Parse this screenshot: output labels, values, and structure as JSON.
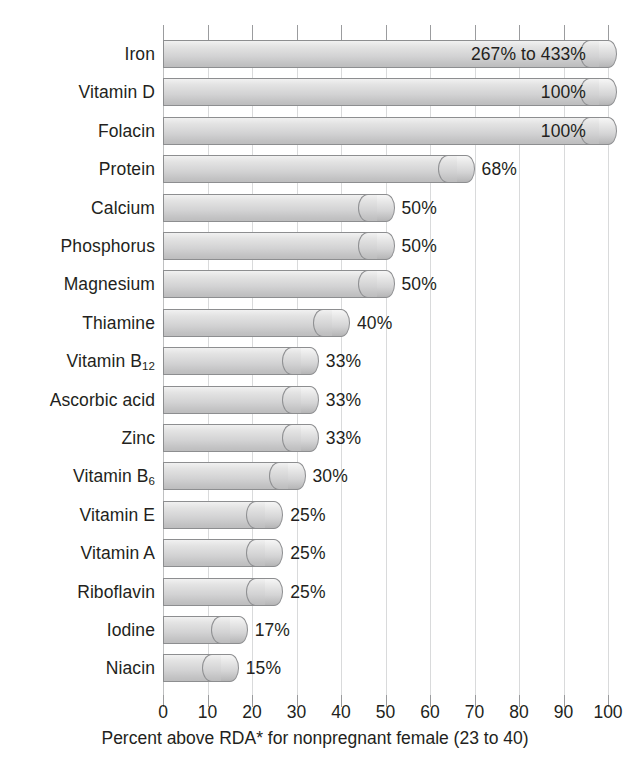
{
  "chart_data": {
    "type": "bar",
    "orientation": "horizontal",
    "title": "",
    "xlabel": "Percent above RDA* for nonpregnant female (23 to 40)",
    "ylabel": "",
    "xlim": [
      0,
      100
    ],
    "xticks": [
      0,
      10,
      20,
      30,
      40,
      50,
      60,
      70,
      80,
      90,
      100
    ],
    "xtick_labels": [
      "0",
      "10",
      "20",
      "30",
      "40",
      "50",
      "60",
      "70",
      "80",
      "90",
      "100"
    ],
    "grid": true,
    "legend": "none",
    "categories": [
      "Iron",
      "Vitamin D",
      "Folacin",
      "Protein",
      "Calcium",
      "Phosphorus",
      "Magnesium",
      "Thiamine",
      "Vitamin B12",
      "Ascorbic acid",
      "Zinc",
      "Vitamin B6",
      "Vitamin E",
      "Vitamin A",
      "Riboflavin",
      "Iodine",
      "Niacin"
    ],
    "values": [
      100,
      100,
      100,
      68,
      50,
      50,
      50,
      40,
      33,
      33,
      33,
      30,
      25,
      25,
      25,
      17,
      15
    ],
    "value_labels": [
      "267% to 433%",
      "100%",
      "100%",
      "68%",
      "50%",
      "50%",
      "50%",
      "40%",
      "33%",
      "33%",
      "33%",
      "30%",
      "25%",
      "25%",
      "25%",
      "17%",
      "15%"
    ]
  },
  "rows": [
    {
      "label_html": "Iron",
      "label": "Iron",
      "value": 100,
      "value_label": "267% to 433%",
      "label_inside": true
    },
    {
      "label_html": "Vitamin D",
      "label": "Vitamin D",
      "value": 100,
      "value_label": "100%",
      "label_inside": true
    },
    {
      "label_html": "Folacin",
      "label": "Folacin",
      "value": 100,
      "value_label": "100%",
      "label_inside": true
    },
    {
      "label_html": "Protein",
      "label": "Protein",
      "value": 68,
      "value_label": "68%",
      "label_inside": false
    },
    {
      "label_html": "Calcium",
      "label": "Calcium",
      "value": 50,
      "value_label": "50%",
      "label_inside": false
    },
    {
      "label_html": "Phosphorus",
      "label": "Phosphorus",
      "value": 50,
      "value_label": "50%",
      "label_inside": false
    },
    {
      "label_html": "Magnesium",
      "label": "Magnesium",
      "value": 50,
      "value_label": "50%",
      "label_inside": false
    },
    {
      "label_html": "Thiamine",
      "label": "Thiamine",
      "value": 40,
      "value_label": "40%",
      "label_inside": false
    },
    {
      "label_html": "Vitamin B<sub>12</sub>",
      "label": "Vitamin B12",
      "value": 33,
      "value_label": "33%",
      "label_inside": false
    },
    {
      "label_html": "Ascorbic acid",
      "label": "Ascorbic acid",
      "value": 33,
      "value_label": "33%",
      "label_inside": false
    },
    {
      "label_html": "Zinc",
      "label": "Zinc",
      "value": 33,
      "value_label": "33%",
      "label_inside": false
    },
    {
      "label_html": "Vitamin B<sub>6</sub>",
      "label": "Vitamin B6",
      "value": 30,
      "value_label": "30%",
      "label_inside": false
    },
    {
      "label_html": "Vitamin E",
      "label": "Vitamin E",
      "value": 25,
      "value_label": "25%",
      "label_inside": false
    },
    {
      "label_html": "Vitamin A",
      "label": "Vitamin A",
      "value": 25,
      "value_label": "25%",
      "label_inside": false
    },
    {
      "label_html": "Riboflavin",
      "label": "Riboflavin",
      "value": 25,
      "value_label": "25%",
      "label_inside": false
    },
    {
      "label_html": "Iodine",
      "label": "Iodine",
      "value": 17,
      "value_label": "17%",
      "label_inside": false
    },
    {
      "label_html": "Niacin",
      "label": "Niacin",
      "value": 15,
      "value_label": "15%",
      "label_inside": false
    }
  ],
  "axis": {
    "caption": "Percent above RDA* for nonpregnant female (23 to 40)",
    "ticks": [
      "0",
      "10",
      "20",
      "30",
      "40",
      "50",
      "60",
      "70",
      "80",
      "90",
      "100"
    ]
  },
  "colors": {
    "bar_fill_light": "#f1f1f1",
    "bar_fill_dark": "#bdbdbe",
    "bar_stroke": "#8d8e90",
    "gridline": "#d9dadb",
    "tick": "#9b9c9e",
    "text": "#231f20",
    "background": "#ffffff"
  }
}
